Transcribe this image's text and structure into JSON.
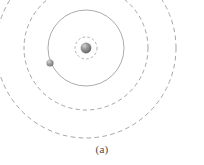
{
  "figure": {
    "caption": "(a)",
    "background_color": "#ffffff",
    "center": {
      "x": 86,
      "y": 48
    }
  },
  "nucleus": {
    "label": "nucleus",
    "cx": 86,
    "cy": 48,
    "r": 5.4,
    "fill_color": "#8f8f91",
    "highlight_color": "#c9c9cb",
    "shadow_color": "#5d5d5f"
  },
  "electron": {
    "label": "electron",
    "cx": 50,
    "cy": 63,
    "r": 3.6,
    "fill_color": "#9a9a9c",
    "highlight_color": "#cacacc",
    "shadow_color": "#6a6a6c"
  },
  "orbits": [
    {
      "name": "inner-shell-orbit",
      "style": "dashed",
      "r": 11,
      "stroke_color": "#9e9ea2",
      "stroke_width": 0.8,
      "dash": "2.6 2.2"
    },
    {
      "name": "electron-orbit",
      "style": "solid",
      "r": 38,
      "stroke_color": "#a2a2a6",
      "stroke_width": 0.9,
      "dash": "none"
    },
    {
      "name": "outer-shell-orbit-1",
      "style": "dashed",
      "r": 62,
      "stroke_color": "#9a9a9e",
      "stroke_width": 0.9,
      "dash": "4.2 3.2"
    },
    {
      "name": "outer-shell-orbit-2",
      "style": "dashed",
      "r": 90,
      "stroke_color": "#9a9a9e",
      "stroke_width": 0.9,
      "dash": "4.6 3.4"
    }
  ]
}
